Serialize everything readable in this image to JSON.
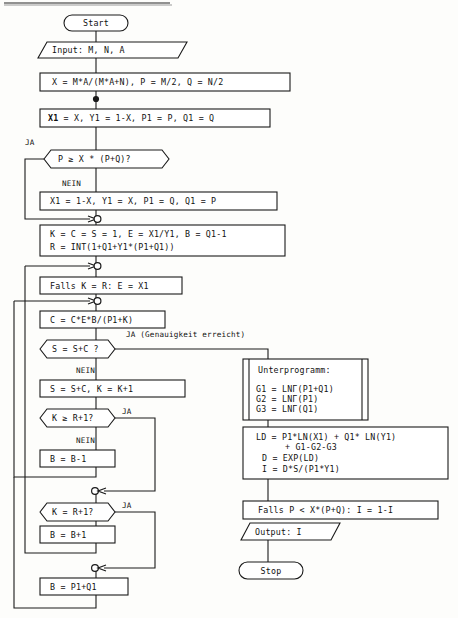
{
  "diagram": {
    "language": "de",
    "nodes": {
      "start": {
        "label": "Start",
        "shape": "terminator"
      },
      "input": {
        "label": "Input: M, N, A",
        "shape": "parallelogram"
      },
      "init1": {
        "label": "X = M*A/(M*A+N), P = M/2, Q = N/2",
        "shape": "process"
      },
      "init2_bold": "X1",
      "init2_rest": " = X, Y1 = 1-X, P1 = P, Q1 = Q",
      "dec1": {
        "label": "P ≥ X * (P+Q)?",
        "shape": "decision"
      },
      "dec1_yes": "JA",
      "dec1_no": "NEIN",
      "swap": {
        "label": "X1 = 1-X, Y1 = X, P1 = Q, Q1 = P",
        "shape": "process"
      },
      "setup_l1": "K = C = S = 1, E = X1/Y1, B = Q1-1",
      "setup_l2": "R = INT(1+Q1+Y1*(P1+Q1))",
      "falls_k": {
        "label": "Falls K = R: E = X1",
        "shape": "process"
      },
      "cupd": {
        "label": "C = C*E*B/(P1+K)",
        "shape": "process"
      },
      "dec2": {
        "label": "S = S+C ?",
        "shape": "decision"
      },
      "dec2_yes": "JA (Genauigkeit erreicht)",
      "dec2_no": "NEIN",
      "supd": {
        "label": "S = S+C, K = K+1",
        "shape": "process"
      },
      "dec3": {
        "label": "K ≥ R+1?",
        "shape": "decision"
      },
      "dec3_yes": "JA",
      "dec3_no": "NEIN",
      "bdec": {
        "label": "B = B-1",
        "shape": "process"
      },
      "dec4": {
        "label": "K = R+1?",
        "shape": "decision"
      },
      "dec4_yes": "JA",
      "binc": {
        "label": "B = B+1",
        "shape": "process"
      },
      "bset": {
        "label": "B = P1+Q1",
        "shape": "process"
      },
      "sub_title": "Unterprogramm:",
      "sub_l1": "G1 = LNΓ(P1+Q1)",
      "sub_l2": "G2 = LNΓ(P1)",
      "sub_l3": "G3 = LNΓ(Q1)",
      "calc_l1": "LD = P1*LN(X1)  + Q1* LN(Y1)",
      "calc_l2": "+ G1-G2-G3",
      "calc_l3": "D = EXP(LD)",
      "calc_l4": "I = D*S/(P1*Y1)",
      "fallsp": {
        "label": "Falls P < X*(P+Q): I = 1-I",
        "shape": "process"
      },
      "output": {
        "label": "Output: I",
        "shape": "parallelogram"
      },
      "stop": {
        "label": "Stop",
        "shape": "terminator"
      }
    },
    "colors": {
      "ink": "#1a1a1a",
      "paper": "#fdfdfb",
      "shape_fill": "#ffffff"
    }
  }
}
